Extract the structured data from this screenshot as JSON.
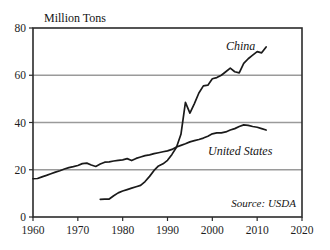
{
  "chart_data": {
    "type": "line",
    "title": "Million Tons",
    "xlabel": "",
    "ylabel": "Million Tons",
    "xlim": [
      1960,
      2020
    ],
    "ylim": [
      0,
      80
    ],
    "xticks": [
      1960,
      1970,
      1980,
      1990,
      2000,
      2010,
      2020
    ],
    "yticks": [
      0,
      20,
      40,
      60,
      80
    ],
    "grid": "horizontal",
    "legend_position": "inline-annotation",
    "annotations": [
      "China",
      "United States",
      "Source: USDA"
    ],
    "source": "Source: USDA",
    "series": [
      {
        "name": "China",
        "color": "#1a1a1a",
        "x": [
          1975,
          1976,
          1977,
          1978,
          1979,
          1980,
          1981,
          1982,
          1983,
          1984,
          1985,
          1986,
          1987,
          1988,
          1989,
          1990,
          1991,
          1992,
          1993,
          1994,
          1995,
          1996,
          1997,
          1998,
          1999,
          2000,
          2001,
          2002,
          2003,
          2004,
          2005,
          2006,
          2007,
          2008,
          2009,
          2010,
          2011,
          2012
        ],
        "values": [
          7.5,
          7.6,
          7.6,
          9.0,
          10.2,
          11.0,
          11.6,
          12.2,
          12.8,
          13.4,
          15.0,
          17.2,
          19.7,
          21.6,
          22.5,
          24.0,
          26.5,
          29.5,
          35.0,
          48.5,
          44.0,
          48.0,
          52.5,
          55.5,
          55.8,
          58.5,
          59.0,
          60.0,
          61.5,
          63.0,
          61.5,
          61.0,
          65.0,
          67.0,
          68.5,
          70.0,
          69.5,
          72.0
        ]
      },
      {
        "name": "United States",
        "color": "#1a1a1a",
        "x": [
          1960,
          1961,
          1962,
          1963,
          1964,
          1965,
          1966,
          1967,
          1968,
          1969,
          1970,
          1971,
          1972,
          1973,
          1974,
          1975,
          1976,
          1977,
          1978,
          1979,
          1980,
          1981,
          1982,
          1983,
          1984,
          1985,
          1986,
          1987,
          1988,
          1989,
          1990,
          1991,
          1992,
          1993,
          1994,
          1995,
          1996,
          1997,
          1998,
          1999,
          2000,
          2001,
          2002,
          2003,
          2004,
          2005,
          2006,
          2007,
          2008,
          2009,
          2010,
          2011,
          2012
        ],
        "values": [
          16.2,
          16.3,
          17.0,
          17.6,
          18.3,
          19.0,
          19.6,
          20.3,
          20.9,
          21.3,
          21.8,
          22.6,
          22.8,
          22.0,
          21.4,
          22.4,
          23.2,
          23.3,
          23.7,
          24.0,
          24.2,
          24.7,
          23.9,
          24.8,
          25.4,
          26.0,
          26.3,
          26.8,
          27.2,
          27.6,
          28.0,
          28.6,
          29.6,
          30.3,
          31.0,
          31.8,
          32.3,
          32.8,
          33.4,
          34.2,
          35.2,
          35.6,
          35.6,
          36.0,
          36.8,
          37.4,
          38.3,
          39.0,
          38.8,
          38.3,
          38.0,
          37.4,
          36.8
        ]
      }
    ]
  },
  "plot": {
    "left": 33,
    "right": 302,
    "top": 28,
    "bottom": 217,
    "frame_color": "#2b2b2b",
    "grid_color": "#9a9a9a",
    "line_color": "#1a1a1a"
  },
  "labels": {
    "title": "Million Tons",
    "china": "China",
    "united_states": "United States",
    "source": "Source: USDA",
    "y": [
      "80",
      "60",
      "40",
      "20",
      "0"
    ],
    "x": [
      "1960",
      "1970",
      "1980",
      "1990",
      "2000",
      "2010",
      "2020"
    ]
  }
}
